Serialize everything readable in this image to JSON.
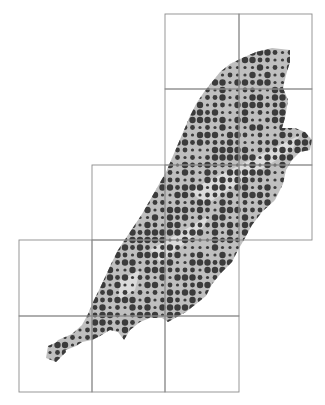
{
  "map": {
    "type": "dot-distribution-map",
    "width": 325,
    "height": 405,
    "colors": {
      "background": "#ffffff",
      "land": "#bfbfbf",
      "land_highlight": "#e2e2e2",
      "dot": "#3b3b3b",
      "grid": "#8c8c8c"
    },
    "grid": {
      "x": [
        19,
        92,
        165,
        239,
        312
      ],
      "y": [
        14,
        89,
        165,
        240,
        316,
        392
      ],
      "cells": [
        [
          2,
          0
        ],
        [
          3,
          0
        ],
        [
          2,
          1
        ],
        [
          3,
          1
        ],
        [
          1,
          2
        ],
        [
          2,
          2
        ],
        [
          3,
          2
        ],
        [
          0,
          3
        ],
        [
          1,
          3
        ],
        [
          2,
          3
        ],
        [
          0,
          4
        ],
        [
          1,
          4
        ],
        [
          2,
          4
        ]
      ]
    },
    "land_outline": [
      [
        290,
        50
      ],
      [
        290,
        62
      ],
      [
        286,
        75
      ],
      [
        283,
        88
      ],
      [
        288,
        100
      ],
      [
        285,
        118
      ],
      [
        282,
        128
      ],
      [
        295,
        128
      ],
      [
        305,
        132
      ],
      [
        312,
        140
      ],
      [
        310,
        150
      ],
      [
        300,
        152
      ],
      [
        292,
        160
      ],
      [
        286,
        170
      ],
      [
        283,
        184
      ],
      [
        275,
        200
      ],
      [
        262,
        212
      ],
      [
        252,
        225
      ],
      [
        245,
        238
      ],
      [
        238,
        250
      ],
      [
        232,
        262
      ],
      [
        222,
        272
      ],
      [
        212,
        284
      ],
      [
        206,
        296
      ],
      [
        196,
        304
      ],
      [
        186,
        312
      ],
      [
        175,
        318
      ],
      [
        168,
        322
      ],
      [
        162,
        318
      ],
      [
        150,
        318
      ],
      [
        140,
        322
      ],
      [
        130,
        330
      ],
      [
        124,
        340
      ],
      [
        118,
        332
      ],
      [
        110,
        330
      ],
      [
        100,
        336
      ],
      [
        92,
        340
      ],
      [
        82,
        342
      ],
      [
        76,
        346
      ],
      [
        66,
        350
      ],
      [
        58,
        356
      ],
      [
        52,
        356
      ],
      [
        50,
        350
      ],
      [
        58,
        340
      ],
      [
        72,
        334
      ],
      [
        82,
        325
      ],
      [
        88,
        314
      ],
      [
        94,
        300
      ],
      [
        100,
        288
      ],
      [
        106,
        275
      ],
      [
        112,
        262
      ],
      [
        118,
        250
      ],
      [
        126,
        238
      ],
      [
        134,
        226
      ],
      [
        142,
        214
      ],
      [
        150,
        200
      ],
      [
        158,
        186
      ],
      [
        166,
        172
      ],
      [
        172,
        158
      ],
      [
        178,
        144
      ],
      [
        184,
        130
      ],
      [
        190,
        116
      ],
      [
        196,
        104
      ],
      [
        204,
        92
      ],
      [
        212,
        82
      ],
      [
        220,
        72
      ],
      [
        230,
        64
      ],
      [
        242,
        58
      ],
      [
        256,
        52
      ],
      [
        272,
        48
      ]
    ],
    "islet": [
      [
        48,
        346
      ],
      [
        62,
        340
      ],
      [
        66,
        352
      ],
      [
        56,
        362
      ],
      [
        46,
        358
      ]
    ],
    "dots": {
      "pitch": 7.5,
      "origin": [
        20,
        15
      ],
      "sizes": {
        "large": 3.2,
        "medium": 2.4,
        "small": 1.6
      },
      "pattern_seed": 17
    }
  }
}
